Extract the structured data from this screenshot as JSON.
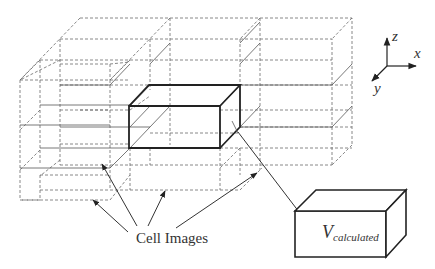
{
  "diagram": {
    "labels": {
      "cell_images": "Cell Images",
      "volume_symbol": "V",
      "volume_subscript": "calculated"
    },
    "axes": {
      "z": "z",
      "x": "x",
      "y": "y"
    },
    "elements": [
      {
        "id": "cell-image-grid",
        "style": "dashed",
        "description": "3x3x2 lattice of replicated cell images"
      },
      {
        "id": "central-cell",
        "style": "bold solid",
        "description": "original simulation cell"
      },
      {
        "id": "calculated-volume-box",
        "style": "solid",
        "description": "enlarged view of calculated volume"
      }
    ],
    "arrows": [
      {
        "from": "Cell Images",
        "to": "image cell left-lower"
      },
      {
        "from": "Cell Images",
        "to": "image cell left-middle"
      },
      {
        "from": "Cell Images",
        "to": "image cell center-lower"
      },
      {
        "from": "Cell Images",
        "to": "image cell right-lower"
      },
      {
        "from": "central cell corner",
        "to": "V_calculated box"
      }
    ],
    "colors": {
      "line": "#222222",
      "dashed": "#6a6a6a",
      "background": "#ffffff"
    }
  }
}
